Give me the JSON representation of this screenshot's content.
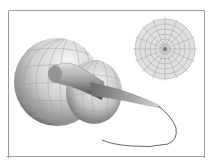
{
  "figure": {
    "kind": "3d-parametric-surface-illustration",
    "colors": {
      "background": "#ffffff",
      "frame": "#9a9a9a",
      "surface_light": "#f4f4f4",
      "surface_mid": "#bdbdbd",
      "surface_dark": "#3a3a3a",
      "mesh": "#9e9e9e",
      "polar_fill": "#d6d6d6",
      "polar_grid": "#8c8c8c",
      "tail": "#555555"
    },
    "polar_inset": {
      "rings": 6,
      "spokes": 16
    }
  }
}
